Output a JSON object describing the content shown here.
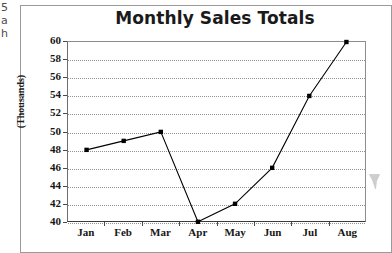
{
  "page": {
    "margin_fragments": [
      "5",
      "a",
      "h"
    ],
    "artifact_name": "scan-smudge"
  },
  "chart_data": {
    "type": "line",
    "title": "Monthly Sales Totals",
    "xlabel": "",
    "ylabel": "(Thousands)",
    "categories": [
      "Jan",
      "Feb",
      "Mar",
      "Apr",
      "May",
      "Jun",
      "Jul",
      "Aug"
    ],
    "values": [
      48,
      49,
      50,
      40,
      42,
      46,
      54,
      60
    ],
    "series": [
      {
        "name": "Monthly Sales",
        "values": [
          48,
          49,
          50,
          40,
          42,
          46,
          54,
          60
        ]
      }
    ],
    "ylim": [
      40,
      60
    ],
    "ytick_step": 2,
    "yticks": [
      60,
      58,
      56,
      54,
      52,
      50,
      48,
      46,
      44,
      42,
      40
    ],
    "grid": true,
    "grid_axis": "y",
    "grid_style": "dotted",
    "legend": false,
    "legend_position": "none",
    "marker": "square",
    "line_color": "#000000",
    "marker_color": "#000000",
    "grid_color": "#909090",
    "axis_color": "#3a3a3a",
    "background_color": "#ffffff"
  }
}
